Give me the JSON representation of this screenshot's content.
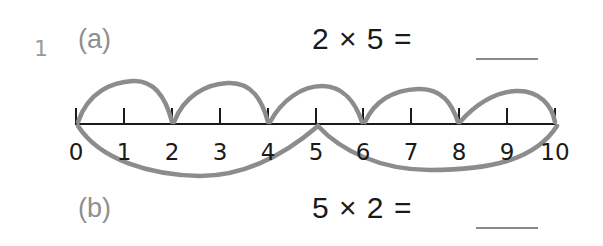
{
  "question": {
    "number": "1",
    "parts": [
      {
        "label": "(a)",
        "expression": "2 × 5 =",
        "answer_blank": "___",
        "jump_size": 2,
        "jumps": [
          [
            0,
            2
          ],
          [
            2,
            4
          ],
          [
            4,
            6
          ],
          [
            6,
            8
          ],
          [
            8,
            10
          ]
        ],
        "arc_position": "above"
      },
      {
        "label": "(b)",
        "expression": "5 × 2 =",
        "answer_blank": "___",
        "jump_size": 5,
        "jumps": [
          [
            0,
            5
          ],
          [
            5,
            10
          ]
        ],
        "arc_position": "below"
      }
    ]
  },
  "number_line": {
    "min": 0,
    "max": 10,
    "tick_labels": [
      "0",
      "1",
      "2",
      "3",
      "4",
      "5",
      "6",
      "7",
      "8",
      "9",
      "10"
    ]
  },
  "colors": {
    "ink": "#1a1a1a",
    "arc": "#8c8c8c",
    "label_grey": "#8f8f8f"
  }
}
